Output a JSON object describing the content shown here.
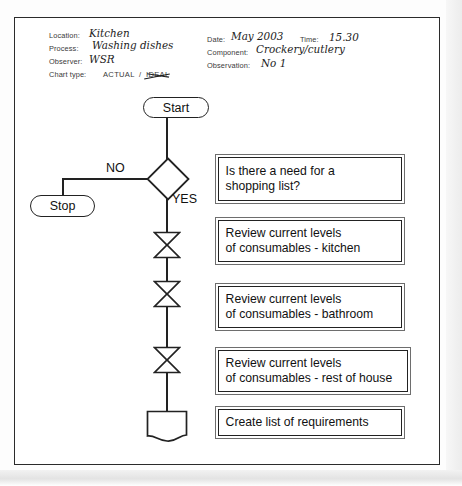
{
  "header": {
    "left_fields": [
      {
        "label": "Location:",
        "value": "Kitchen"
      },
      {
        "label": "Process:",
        "value": "Washing dishes"
      },
      {
        "label": "Observer:",
        "value": "WSR"
      }
    ],
    "chart_type": {
      "label": "Chart type:",
      "option_selected": "ACTUAL",
      "separator": "/",
      "option_struck": "IDEAL"
    },
    "right_fields": [
      {
        "label": "Date:",
        "value": "May 2003"
      },
      {
        "label": "Time:",
        "value": "15.30"
      },
      {
        "label": "Component:",
        "value": "Crockery/cutlery"
      },
      {
        "label": "Observation:",
        "value": "No 1"
      }
    ]
  },
  "flowchart": {
    "start_label": "Start",
    "stop_label": "Stop",
    "branch_no": "NO",
    "branch_yes": "YES",
    "steps": [
      {
        "symbol": "decision-diamond",
        "text_lines": [
          "Is there a need for a",
          "shopping list?"
        ]
      },
      {
        "symbol": "operation-bowtie",
        "text_lines": [
          "Review current levels",
          "of consumables - kitchen"
        ]
      },
      {
        "symbol": "operation-bowtie",
        "text_lines": [
          "Review current levels",
          "of consumables - bathroom"
        ]
      },
      {
        "symbol": "operation-bowtie",
        "text_lines": [
          "Review current levels",
          "of consumables - rest of house"
        ]
      },
      {
        "symbol": "document",
        "text_lines": [
          "Create list of requirements"
        ]
      }
    ]
  },
  "colors": {
    "ink": "#222222",
    "paper": "#ffffff",
    "box_outer": "#6e6e6e"
  }
}
